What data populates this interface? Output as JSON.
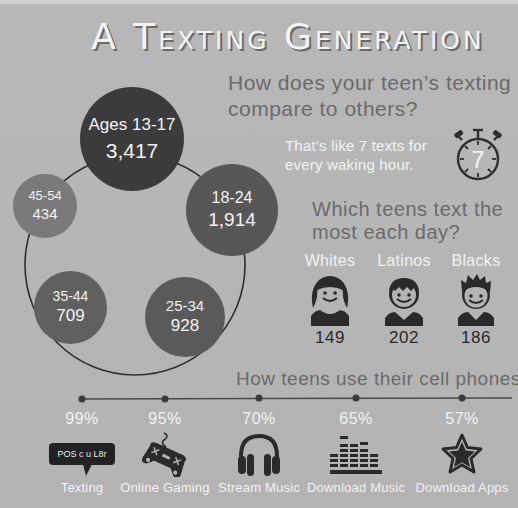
{
  "title": "A Texting Generation",
  "section_age": {
    "question": "How does your teen’s texting compare to others?",
    "groups": [
      {
        "label": "Ages 13-17",
        "value": "3,417"
      },
      {
        "label": "18-24",
        "value": "1,914"
      },
      {
        "label": "25-34",
        "value": "928"
      },
      {
        "label": "35-44",
        "value": "709"
      },
      {
        "label": "45-54",
        "value": "434"
      }
    ],
    "stat_text": "That’s like 7 texts for every waking hour.",
    "stopwatch_value": "7"
  },
  "section_ethnicity": {
    "question": "Which teens text the most each day?",
    "groups": [
      {
        "label": "Whites",
        "value": "149",
        "icon": "girl-avatar-icon"
      },
      {
        "label": "Latinos",
        "value": "202",
        "icon": "boy-avatar-icon"
      },
      {
        "label": "Blacks",
        "value": "186",
        "icon": "boy-spiky-avatar-icon"
      }
    ]
  },
  "section_usage": {
    "heading": "How teens use their cell phones.",
    "items": [
      {
        "pct": "99%",
        "label": "Texting",
        "icon": "speech-bubble-icon",
        "bubble_text": "POS c u L8r"
      },
      {
        "pct": "95%",
        "label": "Online Gaming",
        "icon": "gamepad-icon"
      },
      {
        "pct": "70%",
        "label": "Stream Music",
        "icon": "headphones-icon"
      },
      {
        "pct": "65%",
        "label": "Download Music",
        "icon": "equalizer-icon"
      },
      {
        "pct": "57%",
        "label": "Download Apps",
        "icon": "star-icon"
      }
    ]
  },
  "colors": {
    "background": "#b4b4b4",
    "circle_dark": "#3b3b3b",
    "circle_mid": "#5c5c5c",
    "circle_light": "#7a7a7a",
    "text_light": "#f2f2f2",
    "text_gray": "#6a6a6a"
  }
}
